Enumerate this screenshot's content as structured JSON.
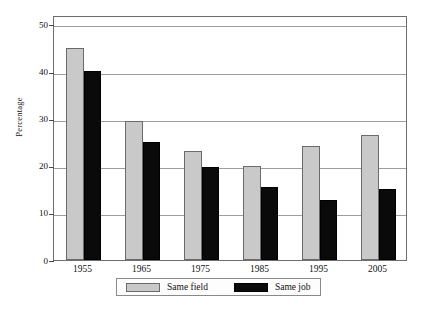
{
  "chart_data": {
    "type": "bar",
    "title": "",
    "subtitle": "",
    "xlabel": "",
    "ylabel": "Percentage",
    "categories": [
      "1955",
      "1965",
      "1975",
      "1985",
      "1995",
      "2005"
    ],
    "series": [
      {
        "name": "Same field",
        "color": "#c9c9c9",
        "values": [
          45.0,
          29.5,
          23.2,
          20.0,
          24.1,
          26.5
        ]
      },
      {
        "name": "Same job",
        "color": "#0a0a0a",
        "values": [
          40.2,
          25.0,
          19.7,
          15.6,
          12.8,
          15.1
        ]
      }
    ],
    "ylim": [
      0,
      52
    ],
    "yticks": [
      0,
      10,
      20,
      30,
      40,
      50
    ],
    "ytick_labels": [
      "0",
      "10",
      "20",
      "30",
      "40",
      "50"
    ],
    "gridlines": [
      10,
      20,
      30,
      40,
      50
    ],
    "grid": true,
    "legend_position": "bottom-center",
    "legend_entries": [
      "Same field",
      "Same job"
    ]
  }
}
